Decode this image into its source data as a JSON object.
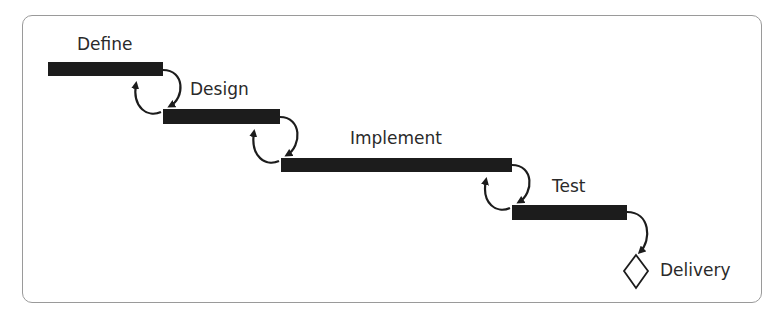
{
  "diagram": {
    "type": "waterfall",
    "phases": [
      {
        "label": "Define",
        "bar": {
          "x": 48,
          "y": 62,
          "w": 115,
          "h": 14
        },
        "label_pos": {
          "x": 77,
          "y": 36
        }
      },
      {
        "label": "Design",
        "bar": {
          "x": 163,
          "y": 109,
          "w": 117,
          "h": 15
        },
        "label_pos": {
          "x": 190,
          "y": 81
        }
      },
      {
        "label": "Implement",
        "bar": {
          "x": 281,
          "y": 158,
          "w": 231,
          "h": 14
        },
        "label_pos": {
          "x": 350,
          "y": 130
        }
      },
      {
        "label": "Test",
        "bar": {
          "x": 512,
          "y": 205,
          "w": 115,
          "h": 15
        },
        "label_pos": {
          "x": 552,
          "y": 178
        }
      }
    ],
    "milestone": {
      "label": "Delivery",
      "shape": "diamond",
      "cx": 636,
      "cy": 271,
      "label_pos": {
        "x": 660,
        "y": 262
      }
    },
    "colors": {
      "bar": "#1c1c1c",
      "arrow": "#1c1c1c",
      "border": "#9a9a9a",
      "text": "#2a2a2a"
    }
  }
}
